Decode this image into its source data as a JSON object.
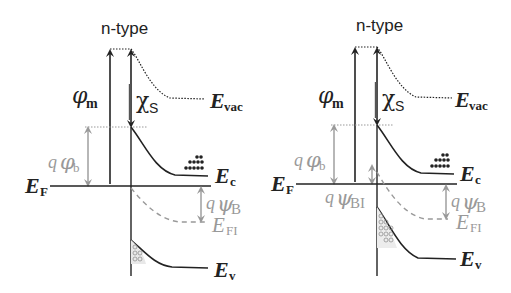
{
  "panels": [
    {
      "id": "left",
      "title": "n-type",
      "labels": {
        "phi_m": {
          "symbol": "φ",
          "sub": "m"
        },
        "chi_s": {
          "symbol": "χ",
          "sub": "S"
        },
        "e_vac": {
          "symbol": "E",
          "sub": "vac"
        },
        "q_phi_b": {
          "prefix": "q",
          "symbol": "φ",
          "sub": "b"
        },
        "e_f": {
          "symbol": "E",
          "sub": "F"
        },
        "e_c": {
          "symbol": "E",
          "sub": "c"
        },
        "q_psi_b": {
          "prefix": "q",
          "symbol": "ψ",
          "sub": "B"
        },
        "e_fi": {
          "symbol": "E",
          "sub": "FI"
        },
        "e_v": {
          "symbol": "E",
          "sub": "v"
        }
      }
    },
    {
      "id": "right",
      "title": "n-type",
      "labels": {
        "phi_m": {
          "symbol": "φ",
          "sub": "m"
        },
        "chi_s": {
          "symbol": "χ",
          "sub": "S"
        },
        "e_vac": {
          "symbol": "E",
          "sub": "vac"
        },
        "q_phi_b": {
          "prefix": "q",
          "symbol": "φ",
          "sub": "b"
        },
        "e_f": {
          "symbol": "E",
          "sub": "F"
        },
        "q_psi_bi": {
          "prefix": "q",
          "symbol": "ψ",
          "sub": "BI"
        },
        "e_c": {
          "symbol": "E",
          "sub": "c"
        },
        "q_psi_b": {
          "prefix": "q",
          "symbol": "ψ",
          "sub": "B"
        },
        "e_fi": {
          "symbol": "E",
          "sub": "FI"
        },
        "e_v": {
          "symbol": "E",
          "sub": "v"
        }
      }
    }
  ],
  "colors": {
    "line": "#222222",
    "gray": "#999999",
    "background": "#ffffff"
  }
}
